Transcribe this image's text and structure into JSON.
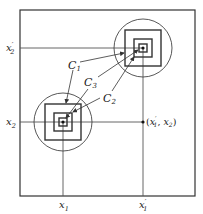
{
  "diagram": {
    "frame": {
      "x": 20,
      "y": 10,
      "w": 175,
      "h": 186
    },
    "axes": {
      "x1": {
        "label": "x",
        "sub": "1",
        "prime": "",
        "x": 63
      },
      "x1p": {
        "label": "x",
        "sub": "1",
        "prime": "′",
        "x": 143
      },
      "x2": {
        "label": "x",
        "sub": "2",
        "prime": "",
        "y": 122
      },
      "x2p": {
        "label": "x",
        "sub": "2",
        "prime": "′",
        "y": 48
      }
    },
    "clusters": [
      {
        "name": "upper",
        "cx": 143,
        "cy": 48,
        "circle_r": 29,
        "squares": [
          18,
          9,
          4
        ]
      },
      {
        "name": "lower",
        "cx": 63,
        "cy": 122,
        "circle_r": 29,
        "squares": [
          18,
          9,
          4
        ]
      }
    ],
    "point_label": "(x′₁, x₂)",
    "point_label_parts": {
      "open": "(",
      "a": "x",
      "a_prime": "′",
      "a_sub": "1",
      "sep": ", ",
      "b": "x",
      "b_sub": "2",
      "close": ")"
    },
    "curve_labels": [
      {
        "text": "C",
        "sub": "1",
        "x": 72,
        "y": 66
      },
      {
        "text": "C",
        "sub": "3",
        "x": 88,
        "y": 84
      },
      {
        "text": "C",
        "sub": "2",
        "x": 104,
        "y": 100
      }
    ],
    "colors": {
      "stroke": "#333333",
      "thin": "#555555",
      "bg": "#ffffff"
    }
  }
}
